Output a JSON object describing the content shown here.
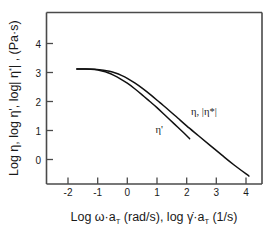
{
  "chart_data": {
    "type": "line",
    "title": "",
    "xlabel": "Log ω·a_T (rad/s), log γ̇·a_T (1/s)",
    "ylabel": "Log η, log η', log| η*| , (Pa·s)",
    "xlim": [
      -2.4,
      4.6
    ],
    "ylim": [
      -1.1,
      4.7
    ],
    "xticks": [
      -2,
      -1,
      0,
      1,
      2,
      3,
      4
    ],
    "xticklabels": [
      "-2",
      "-1",
      "0",
      "1",
      "2",
      "3",
      "4"
    ],
    "yticks": [
      0,
      1,
      2,
      3,
      4
    ],
    "yticklabels": [
      "0",
      "1",
      "2",
      "3",
      "4"
    ],
    "grid": false,
    "legend_position": "inline-annotations",
    "series": [
      {
        "name": "η, |η*|",
        "label": "eta-eta-star",
        "x": [
          -1.7,
          -1.4,
          -1.1,
          -0.8,
          -0.6,
          -0.4,
          -0.2,
          0.0,
          0.25,
          0.5,
          0.8,
          1.1,
          1.4,
          1.7,
          2.0,
          2.4,
          2.8,
          3.2,
          3.6,
          4.1
        ],
        "y": [
          3.12,
          3.12,
          3.11,
          3.08,
          3.04,
          2.98,
          2.9,
          2.8,
          2.64,
          2.46,
          2.22,
          1.96,
          1.7,
          1.43,
          1.16,
          0.82,
          0.48,
          0.14,
          -0.19,
          -0.57
        ]
      },
      {
        "name": "η'",
        "label": "eta-prime",
        "x": [
          -1.7,
          -1.4,
          -1.1,
          -0.85,
          -0.65,
          -0.45,
          -0.25,
          0.0,
          0.25,
          0.5,
          0.75,
          1.0,
          1.3,
          1.6,
          1.9,
          2.1
        ],
        "y": [
          3.12,
          3.12,
          3.1,
          3.05,
          2.99,
          2.9,
          2.79,
          2.63,
          2.44,
          2.23,
          2.01,
          1.79,
          1.5,
          1.21,
          0.92,
          0.72
        ]
      }
    ],
    "annotations": [
      {
        "text": "η, |η*|",
        "x": 2.15,
        "y": 1.55,
        "name": "eta-eta-star-annotation"
      },
      {
        "text": "η'",
        "x": 0.95,
        "y": 0.9,
        "name": "eta-prime-annotation"
      }
    ]
  },
  "axis": {
    "y_title_parts": {
      "p1": "Log η, log η', log| η",
      "p2": "*",
      "p3": "| , (Pa·s)"
    },
    "x_title_parts": {
      "p1": "Log ω·a",
      "p2": "T",
      "p3": " (rad/s), log ",
      "p4": "γ̇",
      "p5": "·a",
      "p6": "T",
      "p7": " (1/s)"
    }
  },
  "colors": {
    "axis": "#4a4a4a",
    "curve": "#111111",
    "text": "#1a1a1a",
    "background": "#ffffff"
  }
}
